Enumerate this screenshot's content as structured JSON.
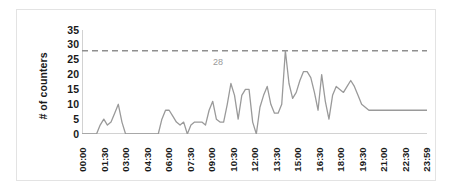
{
  "chart_data": {
    "type": "line",
    "title": "",
    "xlabel": "",
    "ylabel": "# of counters",
    "ylim": [
      0,
      35
    ],
    "yticks": [
      0,
      5,
      10,
      15,
      20,
      25,
      30,
      35
    ],
    "grid": false,
    "legend": "none",
    "line_color": "#9a9a9a",
    "threshold": {
      "value": 28,
      "label": "28",
      "style": "dashed",
      "color": "#8f8f8f"
    },
    "xtick_labels": [
      "00:00",
      "01:30",
      "03:00",
      "04:30",
      "06:00",
      "07:30",
      "09:00",
      "10:30",
      "12:00",
      "13:30",
      "15:00",
      "16:30",
      "18:00",
      "19:30",
      "21:00",
      "22:30",
      "23:59"
    ],
    "x_interval_minutes": 15,
    "series": [
      {
        "name": "# of counters",
        "values": [
          0,
          0,
          0,
          0,
          0,
          3,
          5,
          3,
          4,
          7,
          10,
          4,
          0,
          0,
          0,
          0,
          0,
          0,
          0,
          0,
          0,
          0,
          5,
          8,
          8,
          6,
          4,
          3,
          4,
          0,
          3,
          4,
          4,
          4,
          3,
          8,
          11,
          5,
          4,
          4,
          10,
          17,
          13,
          5,
          13,
          15,
          15,
          4,
          0,
          9,
          13,
          16,
          10,
          7,
          7,
          10,
          28,
          17,
          12,
          14,
          18,
          21,
          21,
          19,
          14,
          8,
          20,
          11,
          5,
          13,
          16,
          15,
          14,
          16,
          18,
          16,
          13,
          10,
          9,
          8,
          8,
          8,
          8,
          8,
          8,
          8,
          8,
          8,
          8,
          8,
          8,
          8,
          8,
          8,
          8,
          8
        ]
      }
    ]
  }
}
